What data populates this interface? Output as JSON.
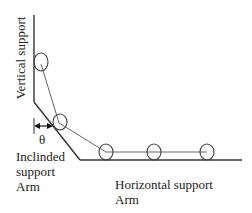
{
  "labels": {
    "vertical_support": "Vertical support",
    "theta": "θ",
    "inclined_line1": "Inclinded",
    "inclined_line2": "support",
    "inclined_line3": "Arm",
    "horizontal_line1": "Horizontal support",
    "horizontal_line2": "Arm"
  },
  "colors": {
    "support_line": "#333333",
    "rod_line": "#666666",
    "circle_stroke": "#444444",
    "text": "#222222"
  }
}
